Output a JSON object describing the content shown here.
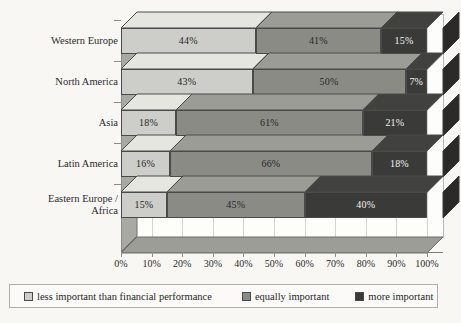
{
  "chart_data": {
    "type": "bar",
    "orientation": "horizontal",
    "stacked": true,
    "style": "3d",
    "title": "",
    "xlabel": "",
    "ylabel": "",
    "xlim": [
      0,
      100
    ],
    "grid": true,
    "legend_position": "bottom",
    "categories": [
      "Western Europe",
      "North America",
      "Asia",
      "Latin America",
      "Eastern Europe / Africa"
    ],
    "category_lines": [
      [
        "Western Europe"
      ],
      [
        "North America"
      ],
      [
        "Asia"
      ],
      [
        "Latin America"
      ],
      [
        "Eastern Europe /",
        "Africa"
      ]
    ],
    "series": [
      {
        "name": "less important than financial performance",
        "color": "#cdcdc9",
        "values": [
          44,
          43,
          18,
          16,
          15
        ],
        "labels": [
          "44%",
          "43%",
          "18%",
          "16%",
          "15%"
        ]
      },
      {
        "name": "equally important",
        "color": "#8b8b86",
        "values": [
          41,
          50,
          61,
          66,
          45
        ],
        "labels": [
          "41%",
          "50%",
          "61%",
          "66%",
          "45%"
        ]
      },
      {
        "name": "more important",
        "color": "#3a3a38",
        "values": [
          15,
          7,
          21,
          18,
          40
        ],
        "labels": [
          "15%",
          "7%",
          "21%",
          "18%",
          "40%"
        ]
      }
    ],
    "xticks": [
      0,
      10,
      20,
      30,
      40,
      50,
      60,
      70,
      80,
      90,
      100
    ],
    "xtick_labels": [
      "0%",
      "10%",
      "20%",
      "30%",
      "40%",
      "50%",
      "60%",
      "70%",
      "80%",
      "90%",
      "100%"
    ]
  },
  "legend": {
    "items": [
      {
        "label": "less important than financial performance",
        "color": "#cdcdc9"
      },
      {
        "label": "equally important",
        "color": "#8b8b86"
      },
      {
        "label": "more important",
        "color": "#3a3a38"
      }
    ]
  }
}
